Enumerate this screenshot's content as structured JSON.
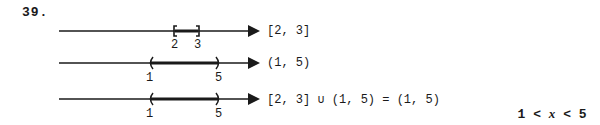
{
  "problem": {
    "number": "39.",
    "lines": [
      {
        "interval": "[2, 3]",
        "left_endpoint": {
          "value": "2",
          "type": "closed",
          "symbol": "["
        },
        "right_endpoint": {
          "value": "3",
          "type": "closed",
          "symbol": "]"
        }
      },
      {
        "interval": "(1, 5)",
        "left_endpoint": {
          "value": "1",
          "type": "open",
          "symbol": "("
        },
        "right_endpoint": {
          "value": "5",
          "type": "open",
          "symbol": ")"
        }
      },
      {
        "interval": "[2, 3] ∪ (1, 5) = (1, 5)",
        "left_endpoint": {
          "value": "1",
          "type": "open",
          "symbol": "("
        },
        "right_endpoint": {
          "value": "5",
          "type": "open",
          "symbol": ")"
        }
      }
    ],
    "inequality": "1 < x < 5"
  }
}
